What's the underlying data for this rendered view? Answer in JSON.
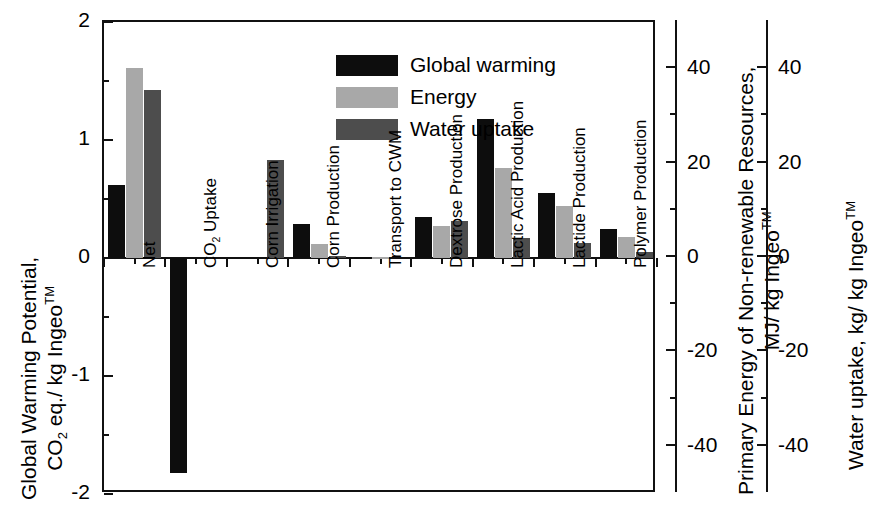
{
  "chart_data": {
    "type": "bar",
    "title": "",
    "categories": [
      "Net",
      "CO2 Uptake",
      "Corn Irrigation",
      "Corn Production",
      "Transport to CWM",
      "Dextrose Production",
      "Lactic Acid Production",
      "Lactide Production",
      "Polymer Production"
    ],
    "category_labels": [
      "Net",
      "CO₂ Uptake",
      "Corn Irrigation",
      "Corn Production",
      "Transport to CWM",
      "Dextrose Production",
      "Lactic Acid Production",
      "Lactide Production",
      "Polymer Production"
    ],
    "series": [
      {
        "name": "Global warming",
        "color": "#0d0d0d",
        "values": [
          0.62,
          -1.82,
          0.0,
          0.29,
          0.01,
          0.35,
          1.18,
          0.55,
          0.25
        ]
      },
      {
        "name": "Energy",
        "color": "#a8a8a8",
        "values": [
          1.61,
          0.0,
          0.0,
          0.12,
          0.01,
          0.27,
          0.76,
          0.44,
          0.18
        ]
      },
      {
        "name": "Water uptake",
        "color": "#4d4d4d",
        "values": [
          1.42,
          0.0,
          0.83,
          0.02,
          0.0,
          0.31,
          0.17,
          0.13,
          0.05
        ]
      }
    ],
    "grid": false,
    "legend_position": "top-center",
    "legend": [
      {
        "label": "Global warming",
        "color": "#0d0d0d"
      },
      {
        "label": "Energy",
        "color": "#a8a8a8"
      },
      {
        "label": "Water uptake",
        "color": "#4d4d4d"
      }
    ],
    "xlabel": "",
    "axes": [
      {
        "id": "left",
        "position": "left",
        "title_line1": "Global Warming Potential,",
        "title_line2": "CO₂ eq./ kg Ingeo™",
        "ylim": [
          -2,
          2
        ],
        "ticks": [
          2,
          1,
          0,
          -1,
          -2
        ],
        "tick_labels": [
          "2",
          "1",
          "0",
          "-1",
          "-2"
        ],
        "minor_ticks": [
          1.5,
          0.5,
          -0.5,
          -1.5
        ]
      },
      {
        "id": "right-energy",
        "position": "right",
        "title_line1": "Primary Energy of Non-renewable Resources,",
        "title_line2": "MJ/ kg Ingeo™",
        "ylim": [
          -50,
          50
        ],
        "ticks": [
          40,
          20,
          0,
          -20,
          -40
        ],
        "tick_labels": [
          "40",
          "20",
          "0",
          "-20",
          "-40"
        ],
        "minor_ticks": [
          30,
          10,
          -10,
          -30
        ]
      },
      {
        "id": "right-water",
        "position": "right",
        "title_line1": "Water uptake, kg/ kg Ingeo™",
        "title_line2": "",
        "ylim": [
          -50,
          50
        ],
        "ticks": [
          40,
          20,
          0,
          -20,
          -40
        ],
        "tick_labels": [
          "40",
          "20",
          "0",
          "-20",
          "-40"
        ],
        "minor_ticks": [
          30,
          10,
          -10,
          -30
        ]
      }
    ]
  }
}
